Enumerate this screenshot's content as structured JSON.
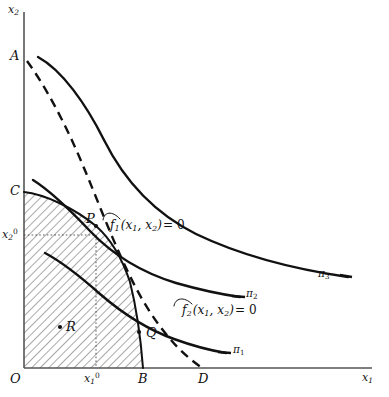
{
  "figure": {
    "background_color": "#ffffff",
    "line_color": "#111111",
    "axis_color": "#555555"
  },
  "axes": {
    "y_axis_label": "x2",
    "x_axis_label": "x1",
    "origin_label": "O",
    "y_ticks": [
      {
        "label": "A",
        "value_desc": "y-intercept of dashed constraint curve f1 = 0"
      },
      {
        "label": "C",
        "value_desc": "y-intercept of solid constraint curve f2 = 0"
      },
      {
        "label": "x20",
        "value_desc": "optimal x2 coordinate at point P"
      }
    ],
    "x_ticks": [
      {
        "label": "x10",
        "value_desc": "optimal x1 coordinate at point P"
      },
      {
        "label": "B",
        "value_desc": "x-intercept of solid constraint curve f2 = 0"
      },
      {
        "label": "D",
        "value_desc": "x-intercept of dashed constraint curve f1 = 0"
      }
    ]
  },
  "points": [
    {
      "name": "P",
      "label": "P",
      "desc": "optimum, intersection of the two constraint curves, on isoquant pi2"
    },
    {
      "name": "Q",
      "label": "Q",
      "desc": "point on boundary curve below P, on isoquant pi1"
    },
    {
      "name": "R",
      "label": "R",
      "desc": "interior feasible point inside hatched region"
    }
  ],
  "curves": [
    {
      "name": "pi1",
      "label": "π1",
      "style": "solid",
      "desc": "lowest profit isoquant"
    },
    {
      "name": "pi2",
      "label": "π2",
      "style": "solid",
      "desc": "middle profit isoquant, tangent at P"
    },
    {
      "name": "pi3",
      "label": "π3",
      "style": "solid",
      "desc": "highest profit isoquant, unattainable"
    },
    {
      "name": "f1",
      "label_parts": {
        "f": "f",
        "sub": "1",
        "args": "(x1, x2)",
        "eq": "= 0"
      },
      "label_plain": "f1 (x1, x2) = 0",
      "style": "dashed",
      "desc": "first constraint, dashed curve from A to D"
    },
    {
      "name": "f2",
      "label_parts": {
        "f": "f",
        "sub": "2",
        "args": "(x1, x2)",
        "eq": "= 0"
      },
      "label_plain": "f2 (x1, x2) = 0",
      "style": "solid",
      "desc": "second constraint, solid curve from C to B"
    }
  ],
  "region": {
    "name": "feasible-set",
    "fill": "hatched",
    "hatch_direction": "backslash",
    "desc": "feasible region O-C-P-B bounded by both constraints and the axes"
  }
}
